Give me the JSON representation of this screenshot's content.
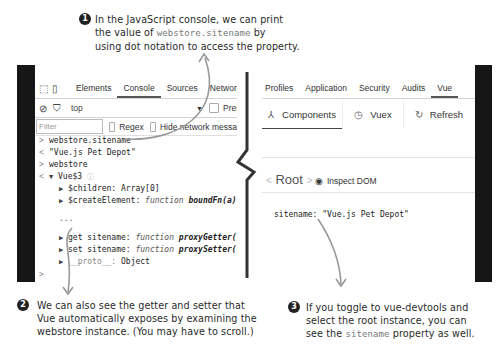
{
  "annotations": [
    {
      "number": "1",
      "lines": [
        "In the JavaScript console, we can print",
        "the value of ",
        "webstore.sitename",
        " by",
        "using dot notation to access the property."
      ]
    },
    {
      "number": "2",
      "lines": [
        "We can also see the getter and setter that",
        "Vue automatically exposes by examining the",
        "webstore instance. (You may have to scroll.)"
      ]
    },
    {
      "number": "3",
      "lines": [
        "If you toggle to vue-devtools and",
        "select the root instance, you can",
        "see the ",
        "sitename",
        " property as well."
      ]
    }
  ],
  "console_panel": {
    "tabs": [
      "Elements",
      "Console",
      "Sources",
      "Network",
      "Tin"
    ],
    "active_tab": "Console",
    "icons": [
      "inspect-element-icon",
      "device-toolbar-icon",
      "clear-console-icon",
      "filter-icon"
    ],
    "context": "top",
    "preserve_log_label": "Preserve",
    "filter_placeholder": "Filter",
    "regex_label": "Regex",
    "hide_network_label": "Hide network messa",
    "lines": [
      {
        "prompt": ">",
        "text": "webstore.sitename"
      },
      {
        "prompt": "<",
        "text": "\"Vue.js Pet Depot\""
      },
      {
        "prompt": ">",
        "text": "webstore"
      },
      {
        "prompt": "<",
        "text": "Vue$3"
      }
    ],
    "tree": {
      "children_key": "$children:",
      "children_val": "Array[0]",
      "create_key": "$createElement:",
      "create_kw": "function",
      "create_fn": "boundFn(a)",
      "ellipsis": "...",
      "get_key": "get sitename:",
      "get_kw": "function",
      "get_fn": "proxyGetter()",
      "set_key": "set sitename:",
      "set_kw": "function",
      "set_fn": "proxySetter(val)",
      "proto_key": "__proto__:",
      "proto_val": "Object"
    },
    "final_prompt": ">"
  },
  "vue_panel": {
    "tabs": [
      "Profiles",
      "Application",
      "Security",
      "Audits",
      "Vue"
    ],
    "active_tab": "Vue",
    "more_icon": "⋮",
    "close_icon": "✕",
    "nav": [
      {
        "icon": "components-icon",
        "glyph": "⅄",
        "label": "Components"
      },
      {
        "icon": "vuex-history-icon",
        "glyph": "◷",
        "label": "Vuex"
      },
      {
        "icon": "refresh-icon",
        "glyph": "↻",
        "label": "Refresh"
      }
    ],
    "root_label": "Root",
    "inspect_dom_label": "Inspect DOM",
    "property_key": "sitename:",
    "property_value": "\"Vue.js Pet Depot\""
  }
}
